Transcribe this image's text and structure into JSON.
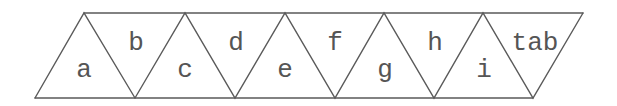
{
  "diagram": {
    "title": "",
    "strip": {
      "top_y": 13,
      "bottom_y": 98,
      "top_x_start": 84,
      "top_x_end": 583,
      "bottom_x_start": 35,
      "bottom_x_end": 533,
      "top_vertices_x": [
        84,
        185,
        285,
        384,
        483,
        583
      ],
      "bottom_vertices_x": [
        35,
        135,
        235,
        335,
        434,
        533
      ]
    },
    "colors": {
      "line": "#5a5a5a",
      "text": "#555555",
      "background": "#ffffff"
    },
    "cells": [
      {
        "label": "a",
        "orientation": "up"
      },
      {
        "label": "b",
        "orientation": "down"
      },
      {
        "label": "c",
        "orientation": "up"
      },
      {
        "label": "d",
        "orientation": "down"
      },
      {
        "label": "e",
        "orientation": "up"
      },
      {
        "label": "f",
        "orientation": "down"
      },
      {
        "label": "g",
        "orientation": "up"
      },
      {
        "label": "h",
        "orientation": "down"
      },
      {
        "label": "i",
        "orientation": "up"
      },
      {
        "label": "tab",
        "orientation": "down"
      }
    ]
  }
}
